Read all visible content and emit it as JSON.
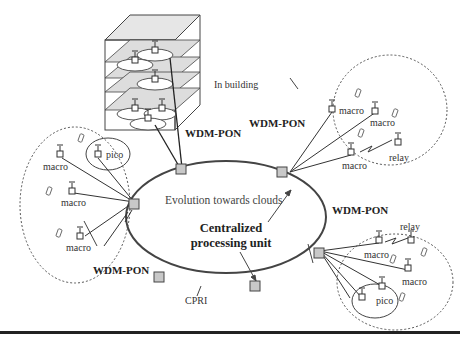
{
  "diagram": {
    "title_labels": {
      "in_building": "In building",
      "evolution": "Evolution towards clouds",
      "centralized_line1": "Centralized",
      "centralized_line2": "processing unit",
      "cpri": "CPRI"
    },
    "wdm_pon_labels": [
      "WDM-PON",
      "WDM-PON",
      "WDM-PON",
      "WDM-PON"
    ],
    "clusters": {
      "left": {
        "labels": [
          "macro",
          "macro",
          "macro",
          "pico"
        ]
      },
      "top_right": {
        "labels": [
          "macro",
          "macro",
          "macro",
          "relay"
        ]
      },
      "bottom_right": {
        "labels": [
          "relay",
          "macro",
          "macro",
          "pico"
        ]
      }
    },
    "colors": {
      "ring": "#444444",
      "node_fill": "#c8c8c8",
      "line": "#333333",
      "floor": "#d8d8d8"
    }
  }
}
